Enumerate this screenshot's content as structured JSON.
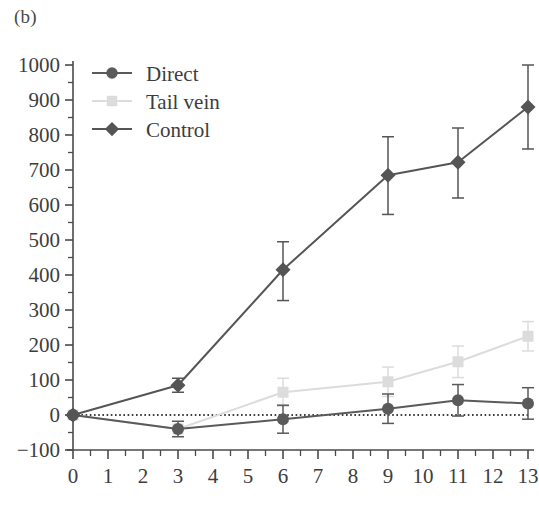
{
  "panel": {
    "label": "(b)"
  },
  "colors": {
    "direct": "#5a5a5a",
    "tail_vein": "#dcdcdc",
    "control": "#555555",
    "axis": "#4a4a4a",
    "text": "#3d3d3d",
    "zero_line": "#3d3d3d",
    "background": "#ffffff"
  },
  "legend": {
    "position": "top-left-inside",
    "entries": [
      {
        "label": "Direct",
        "marker": "circle",
        "color": "#5a5a5a",
        "has_line": true
      },
      {
        "label": "Tail vein",
        "marker": "square",
        "color": "#dcdcdc",
        "has_line": true
      },
      {
        "label": "Control",
        "marker": "diamond",
        "color": "#555555",
        "has_line": true
      }
    ]
  },
  "axes": {
    "y_ticks": [
      "-100",
      "0",
      "100",
      "200",
      "300",
      "400",
      "500",
      "600",
      "700",
      "800",
      "900",
      "1000"
    ],
    "x_ticks": [
      "0",
      "1",
      "2",
      "3",
      "4",
      "5",
      "6",
      "7",
      "8",
      "9",
      "10",
      "11",
      "12",
      "13"
    ],
    "y_minor_step": 50,
    "x_minor_step": 0.5
  },
  "chart_data": {
    "type": "line",
    "title": "(b)",
    "xlabel": "",
    "ylabel": "",
    "xlim": [
      0,
      13
    ],
    "ylim": [
      -100,
      1000
    ],
    "grid": false,
    "legend_position": "upper left",
    "annotations": [
      {
        "type": "hline",
        "y": 0,
        "style": "dotted",
        "label": "zero reference line"
      }
    ],
    "x": [
      0,
      3,
      6,
      9,
      11,
      13
    ],
    "series": [
      {
        "name": "Direct",
        "marker": "circle",
        "color": "#5a5a5a",
        "values": [
          0,
          -40,
          -12,
          18,
          42,
          33
        ],
        "err_low": [
          0,
          22,
          40,
          42,
          45,
          45
        ],
        "err_high": [
          0,
          22,
          40,
          42,
          45,
          45
        ]
      },
      {
        "name": "Tail vein",
        "marker": "square",
        "color": "#dcdcdc",
        "values": [
          0,
          -40,
          65,
          95,
          152,
          225
        ],
        "err_low": [
          0,
          22,
          40,
          42,
          45,
          42
        ],
        "err_high": [
          0,
          22,
          40,
          42,
          45,
          42
        ]
      },
      {
        "name": "Control",
        "marker": "diamond",
        "color": "#555555",
        "values": [
          0,
          85,
          415,
          685,
          722,
          880
        ],
        "err_low": [
          0,
          20,
          88,
          112,
          102,
          120
        ],
        "err_high": [
          0,
          20,
          80,
          110,
          98,
          120
        ]
      }
    ]
  }
}
